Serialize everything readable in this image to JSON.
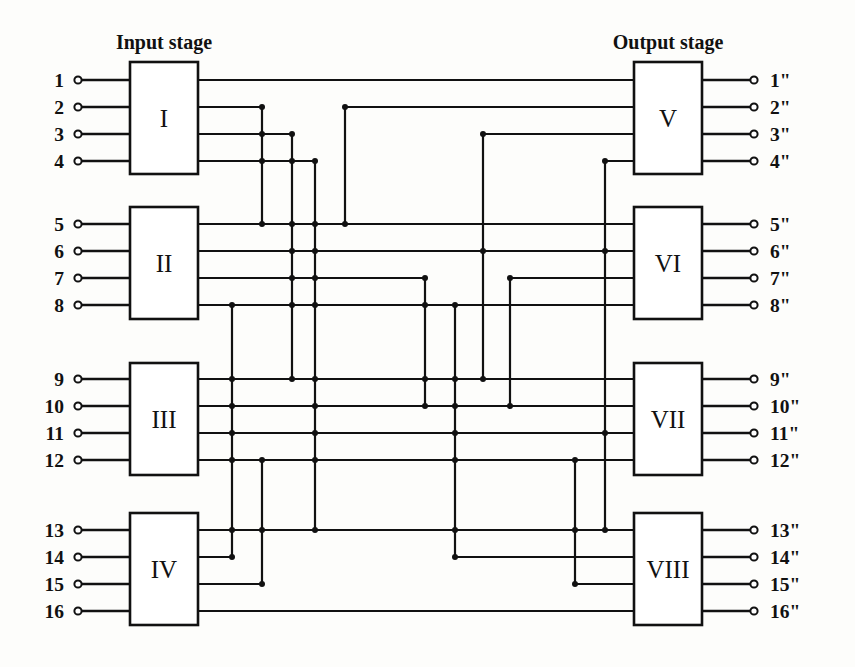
{
  "figure": {
    "kind": "three-stage-clos-switching-network",
    "background": "#fdfdfb",
    "line_color": "#111111",
    "width": 855,
    "height": 667
  },
  "titles": {
    "input_stage": "Input stage",
    "output_stage": "Output stage"
  },
  "input_switches": [
    {
      "label": "I",
      "x": 130,
      "y": 62,
      "w": 68,
      "h": 112,
      "ports": [
        80,
        107,
        134,
        161
      ]
    },
    {
      "label": "II",
      "x": 130,
      "y": 207,
      "w": 68,
      "h": 112,
      "ports": [
        224,
        251,
        278,
        305
      ]
    },
    {
      "label": "III",
      "x": 130,
      "y": 363,
      "w": 68,
      "h": 112,
      "ports": [
        379,
        406,
        433,
        460
      ]
    },
    {
      "label": "IV",
      "x": 130,
      "y": 513,
      "w": 68,
      "h": 112,
      "ports": [
        530,
        557,
        584,
        611
      ]
    }
  ],
  "output_switches": [
    {
      "label": "V",
      "x": 634,
      "y": 62,
      "w": 68,
      "h": 112,
      "ports": [
        80,
        107,
        134,
        161
      ]
    },
    {
      "label": "VI",
      "x": 634,
      "y": 207,
      "w": 68,
      "h": 112,
      "ports": [
        224,
        251,
        278,
        305
      ]
    },
    {
      "label": "VII",
      "x": 634,
      "y": 363,
      "w": 68,
      "h": 112,
      "ports": [
        379,
        406,
        433,
        460
      ]
    },
    {
      "label": "VIII",
      "x": 634,
      "y": 513,
      "w": 68,
      "h": 112,
      "ports": [
        530,
        557,
        584,
        611
      ]
    }
  ],
  "input_terminals": [
    {
      "label": "1",
      "y": 80
    },
    {
      "label": "2",
      "y": 107
    },
    {
      "label": "3",
      "y": 134
    },
    {
      "label": "4",
      "y": 161
    },
    {
      "label": "5",
      "y": 224
    },
    {
      "label": "6",
      "y": 251
    },
    {
      "label": "7",
      "y": 278
    },
    {
      "label": "8",
      "y": 305
    },
    {
      "label": "9",
      "y": 379
    },
    {
      "label": "10",
      "y": 406
    },
    {
      "label": "11",
      "y": 433
    },
    {
      "label": "12",
      "y": 460
    },
    {
      "label": "13",
      "y": 530
    },
    {
      "label": "14",
      "y": 557
    },
    {
      "label": "15",
      "y": 584
    },
    {
      "label": "16",
      "y": 611
    }
  ],
  "output_terminals": [
    {
      "label": "1\"",
      "y": 80
    },
    {
      "label": "2\"",
      "y": 107
    },
    {
      "label": "3\"",
      "y": 134
    },
    {
      "label": "4\"",
      "y": 161
    },
    {
      "label": "5\"",
      "y": 224
    },
    {
      "label": "6\"",
      "y": 251
    },
    {
      "label": "7\"",
      "y": 278
    },
    {
      "label": "8\"",
      "y": 305
    },
    {
      "label": "9\"",
      "y": 379
    },
    {
      "label": "10\"",
      "y": 406
    },
    {
      "label": "11\"",
      "y": 433
    },
    {
      "label": "12\"",
      "y": 460
    },
    {
      "label": "13\"",
      "y": 530
    },
    {
      "label": "14\"",
      "y": 557
    },
    {
      "label": "15\"",
      "y": 584
    },
    {
      "label": "16\"",
      "y": 611
    }
  ],
  "geometry": {
    "input_dot_x": 78,
    "input_label_x": 64,
    "output_dot_x": 754,
    "output_label_x": 770,
    "box_left_x": 130,
    "box_right_x": 198,
    "out_box_left_x": 634,
    "out_box_right_x": 702,
    "input_title_x": 164,
    "output_title_x": 668,
    "title_y": 42
  },
  "interconnect": {
    "description": "Each input switch port k connects to output switch k; routing uses orthogonal trunks.",
    "trunk_x": [
      232,
      262,
      292,
      315,
      345,
      385,
      425,
      455,
      483,
      510,
      545,
      575,
      605
    ],
    "links": [
      {
        "from": "I.1",
        "to": "V.1",
        "path": "M198,80 L634,80"
      },
      {
        "from": "I.2",
        "to": "VI.1",
        "path": "M198,107 L510,107 L510,224 L545,224 L545,107 L634,107"
      },
      {
        "from": "I.3",
        "to": "V.3",
        "path": "M198,134 L455,134 L455,224 L545,224 L545,134 L634,134"
      },
      {
        "from": "I.4",
        "to": "V.4",
        "path": "M198,161 L425,161 L425,224 L575,224 L575,161 L634,161"
      },
      {
        "from": "II.1",
        "to": "V.2",
        "path": "M198,224 L315,224 L315,197 L483,197 L483,107 L634,107"
      },
      {
        "from": "II.2",
        "to": "VI.2",
        "path": "M198,251 L315,251 L315,251 L634,251"
      },
      {
        "from": "II.3",
        "to": "VI.3",
        "path": "M198,278 L385,278 L385,251 L634,278"
      },
      {
        "from": "II.4",
        "to": "VI.4",
        "path": "M198,305 L315,305 L315,330 L605,330 L605,305 L634,305"
      },
      {
        "from": "III.1",
        "to": "V.2",
        "path": "M198,379 L292,379 L292,345 L634,345"
      },
      {
        "from": "III.2",
        "to": "VII.2",
        "path": "M198,406 L634,406"
      },
      {
        "from": "III.3",
        "to": "VII.3",
        "path": "M198,433 L455,433 L455,406 L634,433"
      },
      {
        "from": "III.4",
        "to": "VII.4",
        "path": "M198,460 L385,460 L385,433 L634,460"
      },
      {
        "from": "IV.1",
        "to": "VII.1",
        "path": "M198,530 L345,530 L345,483 L634,483"
      },
      {
        "from": "IV.2",
        "to": "VIII.2",
        "path": "M198,557 L385,557 L385,530 L634,557"
      },
      {
        "from": "IV.3",
        "to": "VIII.3",
        "path": "M198,584 L545,584 L545,570 L575,570 L634,584"
      },
      {
        "from": "IV.4",
        "to": "VIII.4",
        "path": "M198,611 L634,611"
      }
    ]
  }
}
